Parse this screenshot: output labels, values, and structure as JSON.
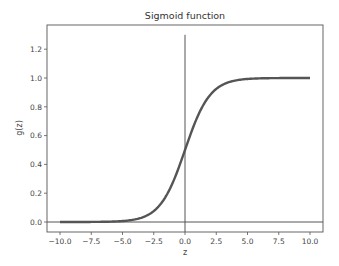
{
  "chart_data": {
    "type": "line",
    "title": "Sigmoid function",
    "xlabel": "z",
    "ylabel": "g(z)",
    "xlim": [
      -11,
      11
    ],
    "ylim": [
      -0.05,
      1.32
    ],
    "x_ticks": [
      -10.0,
      -7.5,
      -5.0,
      -2.5,
      0.0,
      2.5,
      5.0,
      7.5,
      10.0
    ],
    "x_tick_labels": [
      "−10.0",
      "−7.5",
      "−5.0",
      "−2.5",
      "0.0",
      "2.5",
      "5.0",
      "7.5",
      "10.0"
    ],
    "y_ticks": [
      0.0,
      0.2,
      0.4,
      0.6,
      0.8,
      1.0,
      1.2
    ],
    "y_tick_labels": [
      "0.0",
      "0.2",
      "0.4",
      "0.6",
      "0.8",
      "1.0",
      "1.2"
    ],
    "grid": false,
    "legend": null,
    "series": [
      {
        "name": "sigmoid",
        "function": "g(z) = 1 / (1 + e^-z)",
        "x": [
          -10,
          -8,
          -6,
          -5,
          -4,
          -3,
          -2,
          -1,
          0,
          1,
          2,
          3,
          4,
          5,
          6,
          8,
          10
        ],
        "values": [
          0.0,
          0.0003,
          0.0025,
          0.0067,
          0.018,
          0.047,
          0.119,
          0.269,
          0.5,
          0.731,
          0.881,
          0.953,
          0.982,
          0.993,
          0.9975,
          0.9997,
          1.0
        ],
        "color": "#555555"
      }
    ],
    "annotations": [
      {
        "type": "vline",
        "x": 0,
        "y_from": 0,
        "y_to": 1.3,
        "color": "#555555"
      },
      {
        "type": "hline",
        "y": 0,
        "x_from": -11,
        "x_to": 11,
        "color": "#555555"
      }
    ]
  }
}
